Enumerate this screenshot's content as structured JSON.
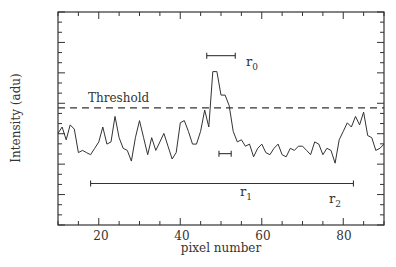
{
  "chart_data": {
    "type": "line",
    "title": "",
    "xlabel": "pixel number",
    "ylabel": "Intensity (adu)",
    "xlim": [
      10,
      90
    ],
    "ylim": [
      0,
      100
    ],
    "y_ticks_labeled": false,
    "x_ticks": [
      20,
      40,
      60,
      80
    ],
    "grid": false,
    "legend": null,
    "series": [
      {
        "name": "intensity profile",
        "x": [
          10,
          11,
          12,
          13,
          14,
          15,
          16,
          17,
          18,
          19,
          20,
          21,
          22,
          23,
          24,
          25,
          26,
          27,
          28,
          29,
          30,
          31,
          32,
          33,
          34,
          35,
          36,
          37,
          38,
          39,
          40,
          41,
          42,
          43,
          44,
          45,
          46,
          47,
          48,
          49,
          50,
          51,
          52,
          53,
          54,
          55,
          56,
          57,
          58,
          59,
          60,
          61,
          62,
          63,
          64,
          65,
          66,
          67,
          68,
          69,
          70,
          71,
          72,
          73,
          74,
          75,
          76,
          77,
          78,
          79,
          80,
          81,
          82,
          83,
          84,
          85,
          86,
          87,
          88,
          89,
          90
        ],
        "y": [
          43,
          46,
          40,
          47,
          45,
          34,
          35,
          34,
          33,
          36,
          39,
          46,
          38,
          39,
          51,
          41,
          36,
          35,
          30,
          41,
          49,
          41,
          33,
          41,
          35,
          39,
          43,
          37,
          31,
          34,
          48,
          49,
          44,
          38,
          38,
          44,
          54,
          46,
          72,
          72,
          61,
          61,
          56,
          44,
          39,
          40,
          37,
          38,
          32,
          36,
          38,
          34,
          33,
          36,
          38,
          33,
          32,
          36,
          35,
          37,
          37,
          35,
          33,
          39,
          38,
          33,
          36,
          35,
          29,
          40,
          44,
          48,
          46,
          51,
          47,
          53,
          42,
          41,
          35,
          36,
          38
        ]
      }
    ],
    "annotations": [
      {
        "label": "Threshold",
        "type": "hline",
        "y": 55,
        "style": "dashed"
      },
      {
        "label": "r0",
        "type": "hbar",
        "x0": 46.5,
        "x1": 53.5,
        "y": 79.5
      },
      {
        "label": "r1",
        "type": "hbar",
        "x0": 49.5,
        "x1": 52.5,
        "y": 33.5
      },
      {
        "label": "r2",
        "type": "hbar",
        "x0": 18,
        "x1": 82.5,
        "y": 19.5
      }
    ]
  },
  "labels": {
    "xlabel": "pixel number",
    "ylabel": "Intensity (adu)",
    "threshold": "Threshold",
    "r0": "r",
    "r0_sub": "0",
    "r1": "r",
    "r1_sub": "1",
    "r2": "r",
    "r2_sub": "2",
    "xticks": [
      "20",
      "40",
      "60",
      "80"
    ]
  }
}
